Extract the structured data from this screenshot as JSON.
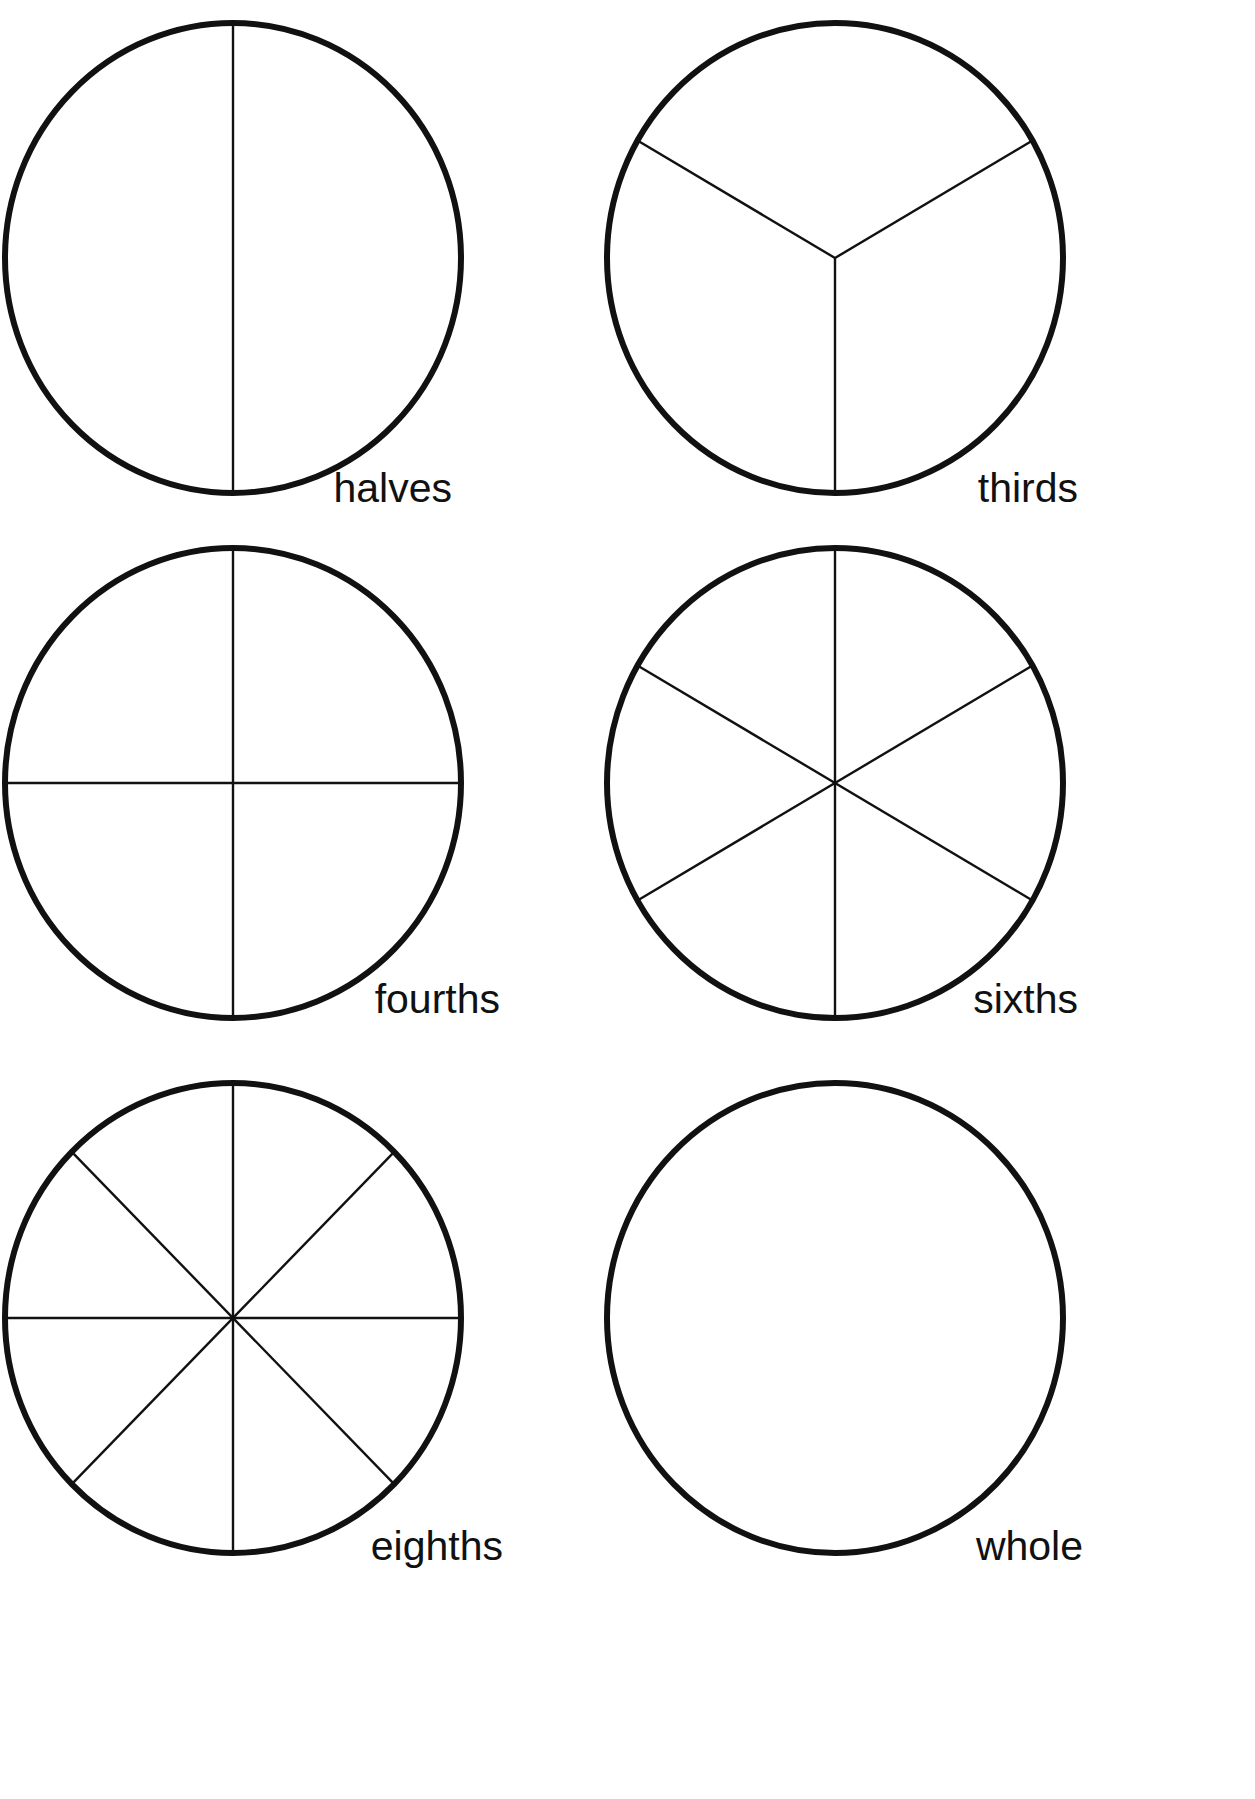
{
  "page": {
    "background_color": "#ffffff",
    "ink_color": "#111111",
    "width": 1255,
    "height": 1799,
    "cropped_header_text": ""
  },
  "figures": [
    {
      "id": "halves",
      "label": "halves",
      "parts": 2,
      "center": {
        "x": 233,
        "y": 258
      },
      "radius_x": 228,
      "radius_y": 235,
      "label_position": {
        "x": 452,
        "y": 502
      },
      "division_type": "radii",
      "division_angles_deg": [
        90,
        270
      ],
      "description": "circle divided into 2 equal halves by one vertical diameter"
    },
    {
      "id": "thirds",
      "label": "thirds",
      "parts": 3,
      "center": {
        "x": 835,
        "y": 258
      },
      "radius_x": 228,
      "radius_y": 235,
      "label_position": {
        "x": 1078,
        "y": 502
      },
      "division_type": "radii",
      "division_angles_deg": [
        90,
        210,
        330
      ],
      "description": "circle divided into 3 equal thirds by three radii"
    },
    {
      "id": "fourths",
      "label": "fourths",
      "parts": 4,
      "center": {
        "x": 233,
        "y": 783
      },
      "radius_x": 228,
      "radius_y": 235,
      "label_position": {
        "x": 500,
        "y": 1013
      },
      "division_type": "radii",
      "division_angles_deg": [
        0,
        90,
        180,
        270
      ],
      "description": "circle divided into 4 equal fourths by vertical and horizontal diameters"
    },
    {
      "id": "sixths",
      "label": "sixths",
      "parts": 6,
      "center": {
        "x": 835,
        "y": 783
      },
      "radius_x": 228,
      "radius_y": 235,
      "label_position": {
        "x": 1078,
        "y": 1013
      },
      "division_type": "radii",
      "division_angles_deg": [
        30,
        90,
        150,
        210,
        270,
        330
      ],
      "description": "circle divided into 6 equal sixths by three diameters"
    },
    {
      "id": "eighths",
      "label": "eighths",
      "parts": 8,
      "center": {
        "x": 233,
        "y": 1318
      },
      "radius_x": 228,
      "radius_y": 235,
      "label_position": {
        "x": 503,
        "y": 1560
      },
      "division_type": "radii",
      "division_angles_deg": [
        0,
        45,
        90,
        135,
        180,
        225,
        270,
        315
      ],
      "description": "circle divided into 8 equal eighths by four diameters"
    },
    {
      "id": "whole",
      "label": "whole",
      "parts": 1,
      "center": {
        "x": 835,
        "y": 1318
      },
      "radius_x": 228,
      "radius_y": 235,
      "label_position": {
        "x": 1083,
        "y": 1560
      },
      "division_type": "none",
      "division_angles_deg": [],
      "description": "undivided whole circle"
    }
  ]
}
